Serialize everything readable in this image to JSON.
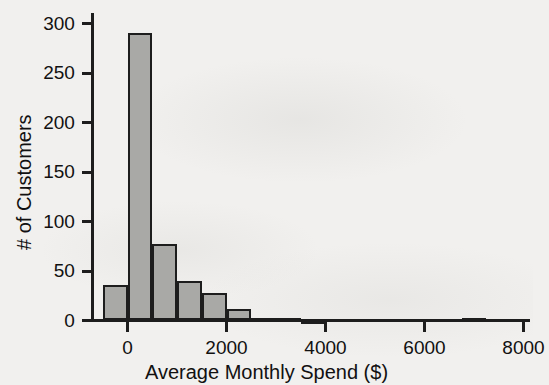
{
  "chart_data": {
    "type": "bar",
    "chart_subtype": "histogram",
    "title": "",
    "xlabel": "Average Monthly Spend ($)",
    "ylabel": "# of Customers",
    "xlim": [
      -700,
      8100
    ],
    "ylim": [
      0,
      305
    ],
    "grid": false,
    "legend": null,
    "bin_width": 500,
    "x_tick_values": [
      0,
      2000,
      4000,
      6000,
      8000
    ],
    "x_tick_labels": [
      "0",
      "2000",
      "4000",
      "6000",
      "8000"
    ],
    "y_tick_values": [
      0,
      50,
      100,
      150,
      200,
      250,
      300
    ],
    "y_tick_labels": [
      "0",
      "50",
      "100",
      "150",
      "200",
      "250",
      "300"
    ],
    "bins": [
      {
        "x0": -500,
        "x1": 0,
        "count": 36
      },
      {
        "x0": 0,
        "x1": 500,
        "count": 290
      },
      {
        "x0": 500,
        "x1": 1000,
        "count": 77
      },
      {
        "x0": 1000,
        "x1": 1500,
        "count": 40
      },
      {
        "x0": 1500,
        "x1": 2000,
        "count": 28
      },
      {
        "x0": 2000,
        "x1": 2500,
        "count": 12
      },
      {
        "x0": 2500,
        "x1": 3000,
        "count": 3
      },
      {
        "x0": 3000,
        "x1": 3500,
        "count": 3
      },
      {
        "x0": 3500,
        "x1": 4000,
        "count": 1
      },
      {
        "x0": 6750,
        "x1": 7250,
        "count": 3
      }
    ],
    "colors": {
      "bar_fill": "#a9a9a6",
      "bar_edge": "#1d1d1d",
      "axis": "#1d1d1d",
      "text": "#111111",
      "background": "#f1f0ee"
    }
  }
}
